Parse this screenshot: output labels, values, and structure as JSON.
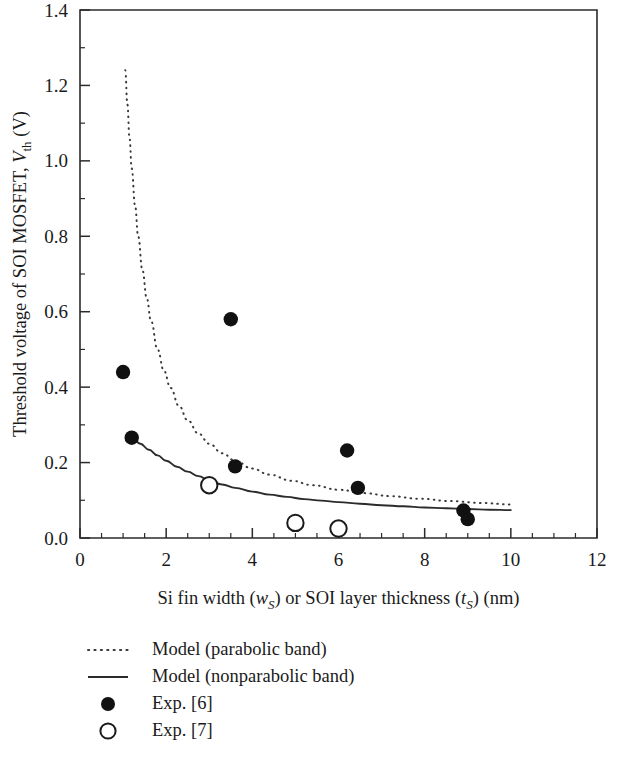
{
  "chart_data": {
    "type": "scatter",
    "title": "",
    "xlabel": "Si fin width (wS) or SOI layer thickness (tS) (nm)",
    "ylabel": "Threshold voltage of SOI MOSFET, Vth (V)",
    "xlim": [
      0,
      12
    ],
    "ylim": [
      0,
      1.4
    ],
    "x_major_ticks": [
      0,
      2,
      4,
      6,
      8,
      10,
      12
    ],
    "x_tick_labels": [
      "0",
      "2",
      "4",
      "6",
      "8",
      "10",
      "12"
    ],
    "x_minor_step": 0.5,
    "y_major_ticks": [
      0.0,
      0.2,
      0.4,
      0.6,
      0.8,
      1.0,
      1.2,
      1.4
    ],
    "y_tick_labels": [
      "0.0",
      "0.2",
      "0.4",
      "0.6",
      "0.8",
      "1.0",
      "1.2",
      "1.4"
    ],
    "y_minor_step": 0.1,
    "grid": false,
    "legend_position": "below-plot-left",
    "axis_label_parts": {
      "x": {
        "seg1": "Si fin width (",
        "var1": "w",
        "var1sub": "S",
        "seg2": ") or SOI layer thickness (",
        "var2": "t",
        "var2sub": "S",
        "seg3": ") (nm)"
      },
      "y": {
        "seg1": "Threshold voltage of SOI MOSFET, ",
        "var1": "V",
        "var1sub": "th",
        "seg2": " (V)"
      }
    },
    "series": [
      {
        "name": "Model (parabolic band)",
        "type": "line",
        "style": "dotted",
        "color": "#3a3a3a",
        "points": [
          [
            1.05,
            1.24
          ],
          [
            1.1,
            1.15
          ],
          [
            1.15,
            1.06
          ],
          [
            1.2,
            0.98
          ],
          [
            1.28,
            0.88
          ],
          [
            1.35,
            0.8
          ],
          [
            1.45,
            0.71
          ],
          [
            1.55,
            0.635
          ],
          [
            1.65,
            0.575
          ],
          [
            1.8,
            0.5
          ],
          [
            1.95,
            0.443
          ],
          [
            2.1,
            0.398
          ],
          [
            2.3,
            0.35
          ],
          [
            2.5,
            0.312
          ],
          [
            2.75,
            0.277
          ],
          [
            3.0,
            0.25
          ],
          [
            3.3,
            0.225
          ],
          [
            3.6,
            0.205
          ],
          [
            4.0,
            0.184
          ],
          [
            4.4,
            0.168
          ],
          [
            4.9,
            0.152
          ],
          [
            5.4,
            0.14
          ],
          [
            6.0,
            0.128
          ],
          [
            6.6,
            0.119
          ],
          [
            7.2,
            0.111
          ],
          [
            7.9,
            0.104
          ],
          [
            8.6,
            0.098
          ],
          [
            9.3,
            0.093
          ],
          [
            10.0,
            0.089
          ]
        ]
      },
      {
        "name": "Model (nonparabolic band)",
        "type": "line",
        "style": "solid",
        "color": "#2b2b2b",
        "points": [
          [
            1.2,
            0.266
          ],
          [
            1.4,
            0.25
          ],
          [
            1.6,
            0.234
          ],
          [
            1.8,
            0.219
          ],
          [
            2.0,
            0.205
          ],
          [
            2.25,
            0.189
          ],
          [
            2.5,
            0.176
          ],
          [
            2.75,
            0.164
          ],
          [
            3.0,
            0.153
          ],
          [
            3.3,
            0.142
          ],
          [
            3.6,
            0.133
          ],
          [
            4.0,
            0.123
          ],
          [
            4.4,
            0.115
          ],
          [
            4.8,
            0.109
          ],
          [
            5.2,
            0.103
          ],
          [
            5.6,
            0.099
          ],
          [
            6.0,
            0.095
          ],
          [
            6.5,
            0.091
          ],
          [
            7.0,
            0.087
          ],
          [
            7.5,
            0.084
          ],
          [
            8.0,
            0.081
          ],
          [
            8.5,
            0.079
          ],
          [
            9.0,
            0.077
          ],
          [
            9.5,
            0.075
          ],
          [
            10.0,
            0.074
          ]
        ]
      },
      {
        "name": "Exp. [6]",
        "type": "scatter",
        "marker": "filled-circle",
        "color": "#111111",
        "points": [
          [
            1.0,
            0.44
          ],
          [
            1.2,
            0.266
          ],
          [
            3.5,
            0.58
          ],
          [
            3.6,
            0.19
          ],
          [
            6.2,
            0.232
          ],
          [
            6.45,
            0.133
          ],
          [
            8.9,
            0.073
          ],
          [
            9.0,
            0.05
          ]
        ]
      },
      {
        "name": "Exp. [7]",
        "type": "scatter",
        "marker": "open-circle",
        "color": "#1a1a1a",
        "points": [
          [
            3.0,
            0.14
          ],
          [
            5.0,
            0.04
          ],
          [
            6.0,
            0.025
          ]
        ]
      }
    ],
    "legend": [
      {
        "label": "Model (parabolic band)",
        "marker": "dotted-line"
      },
      {
        "label": "Model (nonparabolic band)",
        "marker": "solid-line"
      },
      {
        "label": "Exp. [6]",
        "marker": "filled-circle"
      },
      {
        "label": "Exp. [7]",
        "marker": "open-circle"
      }
    ]
  }
}
